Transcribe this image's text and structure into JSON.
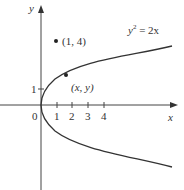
{
  "figure": {
    "axes": {
      "x_label": "x",
      "y_label": "y",
      "origin_label": "0",
      "x_ticks": [
        "1",
        "2",
        "3",
        "4"
      ],
      "y_ticks": [
        "1"
      ]
    },
    "curve": {
      "equation_label": "y² = 2x",
      "equation_base": "y",
      "equation_exp": "2",
      "equation_rhs": " = 2x"
    },
    "points": [
      {
        "label": "(1, 4)",
        "x": 1,
        "y": 4
      },
      {
        "label": "(x, y)",
        "description": "general point on parabola"
      }
    ]
  },
  "colors": {
    "ink": "#333333",
    "background": "#ffffff"
  }
}
